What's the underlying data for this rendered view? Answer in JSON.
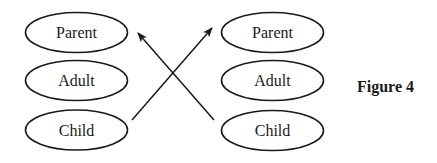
{
  "diagram": {
    "caption": "Figure 4",
    "left_column": {
      "nodes": [
        {
          "label": "Parent"
        },
        {
          "label": "Adult"
        },
        {
          "label": "Child"
        }
      ]
    },
    "right_column": {
      "nodes": [
        {
          "label": "Parent"
        },
        {
          "label": "Adult"
        },
        {
          "label": "Child"
        }
      ]
    },
    "edges": [
      {
        "from": "left.Child",
        "to": "right.Parent",
        "type": "arrow"
      },
      {
        "from": "right.Child",
        "to": "left.Parent",
        "type": "arrow"
      }
    ],
    "colors": {
      "stroke": "#1a1a1a",
      "background": "#ffffff"
    }
  }
}
